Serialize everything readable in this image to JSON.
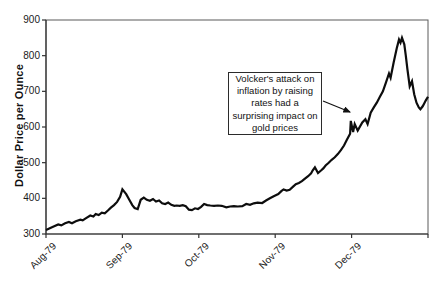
{
  "colors": {
    "background": "#ffffff",
    "series_line": "#0d0d0d",
    "frame": "#5a5a5a",
    "axis": "#333333",
    "text": "#1a1a1a"
  },
  "y_axis_title": "Dollar Price per Ounce",
  "annotation": {
    "text": "Volcker's attack on\ninflation by raising\nrates had a\nsurprising impact on\ngold prices",
    "arrow_from_xy": [
      323,
      101
    ],
    "arrow_to_xy": [
      350,
      112
    ]
  },
  "chart_data": {
    "type": "line",
    "title": "",
    "xlabel": "",
    "ylabel": "Dollar Price per Ounce",
    "ylim": [
      300,
      900
    ],
    "yticks": [
      300,
      400,
      500,
      600,
      700,
      800,
      900
    ],
    "x_categories": [
      "Aug-79",
      "Sep-79",
      "Oct-79",
      "Nov-79",
      "Dec-79"
    ],
    "xlim": [
      0,
      5
    ],
    "grid": false,
    "legend": "none",
    "series": [
      {
        "name": "Gold price (dollars per ounce)",
        "x_unit": "months after Aug-79 tick",
        "points": [
          [
            0.0,
            311
          ],
          [
            0.05,
            316
          ],
          [
            0.1,
            321
          ],
          [
            0.16,
            327
          ],
          [
            0.2,
            324
          ],
          [
            0.25,
            330
          ],
          [
            0.3,
            334
          ],
          [
            0.34,
            330
          ],
          [
            0.39,
            336
          ],
          [
            0.45,
            340
          ],
          [
            0.48,
            338
          ],
          [
            0.52,
            344
          ],
          [
            0.58,
            352
          ],
          [
            0.62,
            349
          ],
          [
            0.65,
            356
          ],
          [
            0.69,
            353
          ],
          [
            0.73,
            360
          ],
          [
            0.77,
            358
          ],
          [
            0.81,
            366
          ],
          [
            0.85,
            374
          ],
          [
            0.89,
            381
          ],
          [
            0.93,
            390
          ],
          [
            0.97,
            404
          ],
          [
            1.0,
            425
          ],
          [
            1.05,
            412
          ],
          [
            1.09,
            396
          ],
          [
            1.13,
            381
          ],
          [
            1.16,
            373
          ],
          [
            1.2,
            370
          ],
          [
            1.24,
            396
          ],
          [
            1.28,
            402
          ],
          [
            1.32,
            396
          ],
          [
            1.36,
            393
          ],
          [
            1.4,
            398
          ],
          [
            1.44,
            391
          ],
          [
            1.48,
            394
          ],
          [
            1.52,
            386
          ],
          [
            1.56,
            384
          ],
          [
            1.6,
            388
          ],
          [
            1.64,
            382
          ],
          [
            1.68,
            379
          ],
          [
            1.71,
            380
          ],
          [
            1.75,
            379
          ],
          [
            1.79,
            381
          ],
          [
            1.83,
            378
          ],
          [
            1.87,
            368
          ],
          [
            1.91,
            367
          ],
          [
            1.95,
            372
          ],
          [
            1.99,
            370
          ],
          [
            2.03,
            376
          ],
          [
            2.07,
            384
          ],
          [
            2.11,
            381
          ],
          [
            2.15,
            380
          ],
          [
            2.2,
            379
          ],
          [
            2.25,
            380
          ],
          [
            2.3,
            379
          ],
          [
            2.36,
            375
          ],
          [
            2.41,
            377
          ],
          [
            2.46,
            378
          ],
          [
            2.51,
            377
          ],
          [
            2.57,
            378
          ],
          [
            2.62,
            384
          ],
          [
            2.67,
            382
          ],
          [
            2.72,
            386
          ],
          [
            2.77,
            388
          ],
          [
            2.83,
            387
          ],
          [
            2.88,
            394
          ],
          [
            2.93,
            400
          ],
          [
            2.98,
            406
          ],
          [
            3.04,
            412
          ],
          [
            3.08,
            420
          ],
          [
            3.11,
            425
          ],
          [
            3.15,
            422
          ],
          [
            3.19,
            424
          ],
          [
            3.23,
            432
          ],
          [
            3.27,
            440
          ],
          [
            3.31,
            443
          ],
          [
            3.35,
            448
          ],
          [
            3.39,
            455
          ],
          [
            3.43,
            462
          ],
          [
            3.47,
            470
          ],
          [
            3.49,
            478
          ],
          [
            3.52,
            487
          ],
          [
            3.56,
            471
          ],
          [
            3.6,
            478
          ],
          [
            3.63,
            484
          ],
          [
            3.66,
            492
          ],
          [
            3.7,
            500
          ],
          [
            3.74,
            508
          ],
          [
            3.78,
            515
          ],
          [
            3.82,
            524
          ],
          [
            3.86,
            535
          ],
          [
            3.9,
            548
          ],
          [
            3.94,
            565
          ],
          [
            3.98,
            581
          ],
          [
            3.99,
            617
          ],
          [
            4.02,
            586
          ],
          [
            4.04,
            608
          ],
          [
            4.08,
            590
          ],
          [
            4.14,
            613
          ],
          [
            4.18,
            622
          ],
          [
            4.21,
            608
          ],
          [
            4.25,
            640
          ],
          [
            4.29,
            655
          ],
          [
            4.33,
            668
          ],
          [
            4.37,
            685
          ],
          [
            4.41,
            700
          ],
          [
            4.45,
            725
          ],
          [
            4.49,
            750
          ],
          [
            4.51,
            738
          ],
          [
            4.55,
            780
          ],
          [
            4.59,
            820
          ],
          [
            4.62,
            845
          ],
          [
            4.64,
            836
          ],
          [
            4.66,
            850
          ],
          [
            4.69,
            832
          ],
          [
            4.71,
            800
          ],
          [
            4.73,
            762
          ],
          [
            4.76,
            714
          ],
          [
            4.79,
            728
          ],
          [
            4.82,
            692
          ],
          [
            4.85,
            668
          ],
          [
            4.88,
            655
          ],
          [
            4.9,
            650
          ],
          [
            4.93,
            658
          ],
          [
            4.95,
            666
          ],
          [
            4.97,
            674
          ],
          [
            5.0,
            685
          ]
        ]
      }
    ],
    "annotation_text": "Volcker's attack on inflation by raising rates had a surprising impact on gold prices"
  },
  "layout_px": {
    "plot_left": 46,
    "plot_right": 428,
    "plot_top": 20,
    "plot_bottom": 234,
    "width": 436,
    "height": 282
  }
}
